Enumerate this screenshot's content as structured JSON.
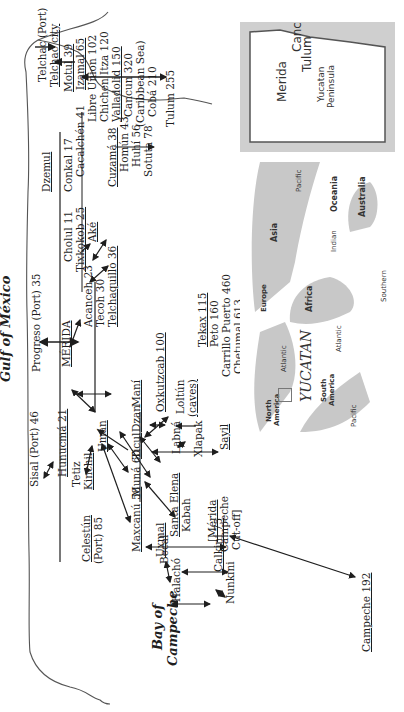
{
  "seas": {
    "gulf": "Gulf of México",
    "bay_line1": "Bay of",
    "bay_line2": "Campeche"
  },
  "places": {
    "telchac_port": "Telchac (Port)",
    "telchac_city": "Telchac city",
    "dzemul": "Dzemul",
    "conkal": "Conkal 17",
    "motul": "Motul 39",
    "cacalchen": "Cacalchén 41",
    "izamal": "Izamal 65",
    "libre_union": "Libre Union 102",
    "chichen": "Chichen Itza 120",
    "valladolid": "Valladolid 150",
    "cancun": "Cancun 320",
    "caribbean": "(Caribbean Sea)",
    "coba": "Cobá 210",
    "tulum": "Tulum 255",
    "progreso": "Progreso (Port) 35",
    "cholul": "Cholul 11",
    "tixkokob": "Tixkokob 25",
    "ake": "Aké",
    "cuzama": "Cuzamá 38",
    "homun": "Homún 43",
    "huhi": "Huhí 56",
    "sotuta": "Sotuta 78",
    "merida": "MÉRIDA",
    "acanceh": "Acanceh 23",
    "tecoh": "Tecoh 30",
    "telchaquillo": "Telchaquillo 36",
    "oxkutzcab": "Oxkutzcab 100",
    "tekax": "Tekax 115",
    "peto": "Peto 160",
    "carrillo": "Carrillo Puerto 460",
    "chetumal": "Chetumal 613",
    "loltun": "Loltún",
    "caves": "(caves)",
    "labna": "Labná",
    "xlapak": "Xlapak",
    "sayil": "Sayil",
    "uman": "Umán",
    "muna": "Muná 60",
    "ticul": "Ticul",
    "dzan": "Dzan",
    "mani": "Maní",
    "santa_elena": "Santa Elena",
    "kabah": "Kabah",
    "merida_cutoff_1": "[Mérida",
    "merida_cutoff_2": "Campeche",
    "merida_cutoff_3": "Cut-off]",
    "uxmal": "Uxmal",
    "sisal": "Sisal (Port) 46",
    "hunucma": "Hunucmá 21",
    "tetiz": "Tetiz",
    "kinchil": "Kinchil",
    "maxcanu": "Maxcanú 58",
    "celestun_1": "Celestún",
    "celestun_2": "(Port) 85",
    "becal": "Becal",
    "halacho": "Halachó",
    "calkini": "Calkiní 75",
    "nunkini": "Nunkini",
    "campeche": "Campeche 192"
  },
  "inset_yucatan": {
    "cancun": "Cancun",
    "tulum": "Tulum",
    "merida": "Merida",
    "peninsula_1": "Yucatan",
    "peninsula_2": "Peninsula",
    "gulf": "Gulf of Mexico",
    "campeche": "Campeche",
    "chetumal": "Chetumal",
    "belize": "Belize"
  },
  "inset_world": {
    "north_america_1": "North",
    "north_america_2": "America",
    "south_america_1": "South",
    "south_america_2": "America",
    "europe": "Europe",
    "africa": "Africa",
    "asia": "Asia",
    "oceania": "Oceania",
    "australia": "Australia",
    "atlantic_n": "Atlantic",
    "atlantic_s": "Atlantic",
    "pacific_w": "Pacific",
    "pacific_e": "Pacific",
    "indian": "Indian",
    "southern": "Southern",
    "yucatan": "YUCATAN"
  },
  "colors": {
    "ink": "#1e1e1e",
    "land": "#ffffff",
    "water": "#c9c9c9",
    "coast": "#555555"
  }
}
